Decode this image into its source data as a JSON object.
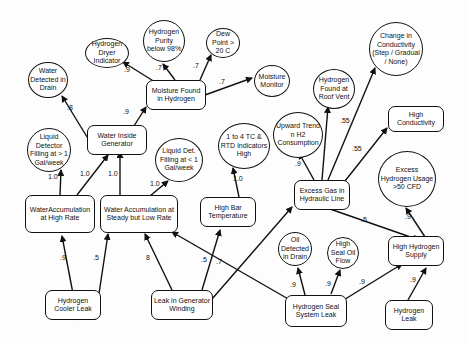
{
  "nodes": {
    "h2_dryer": {
      "label": "Hydrogen Dryer Indicator"
    },
    "h2_purity": {
      "label": "Hydrogen Purity below 98%"
    },
    "dew_point": {
      "label": "Dew Point > 20 C"
    },
    "moisture_monitor": {
      "label": "Moisture Monitor"
    },
    "moisture_found": {
      "label": "Moisture Found in Hydrogen"
    },
    "water_drain": {
      "label": "Water Detected in Drain"
    },
    "liquid_det_gt1": {
      "label": "Liquid Detector Filling at > 1 Gal/week"
    },
    "water_inside": {
      "label": "Water Inside Generator"
    },
    "liquid_det_lt1": {
      "label": "Liquid Det. Filling at < 1 Gal/week"
    },
    "tc_rtd": {
      "label": "1 to 4 TC & RTD Indicators High"
    },
    "upward_trend": {
      "label": "Upward Trend n H2 Consumption"
    },
    "h2_roof_vent": {
      "label": "Hydrogen Found at Roof Vent"
    },
    "conductivity_change": {
      "label": "Change in Conductivity (Step / Gradual / None)"
    },
    "high_conductivity": {
      "label": "High Conductivity"
    },
    "excess_h2_usage": {
      "label": "Excess Hydrogen Usage >50 CFD"
    },
    "excess_gas": {
      "label": "Excess Gas in Hydraulic Line"
    },
    "water_accum_high": {
      "label": "WaterAccumulation at High Rate"
    },
    "water_accum_low": {
      "label": "Water Accumulation at Steady but Low Rate"
    },
    "high_bar_temp": {
      "label": "High Bar Temperature"
    },
    "oil_drain": {
      "label": "Oil Detected in Drain"
    },
    "high_seal_oil": {
      "label": "High Seal Oil Flow"
    },
    "high_h2_supply": {
      "label": "High Hydrogen Supply"
    },
    "h2_cooler_leak": {
      "label": "Hydrogen Cooler Leak"
    },
    "gen_winding_leak": {
      "label": "Leak in Generator Winding"
    },
    "h2_seal_leak": {
      "label": "Hydrogen Seal System Leak"
    },
    "h2_leak": {
      "label": "Hydrogen Leak"
    }
  },
  "edges": [
    {
      "from": "moisture_found",
      "to": "h2_dryer",
      "weight": ".9"
    },
    {
      "from": "moisture_found",
      "to": "h2_purity",
      "weight": ".7"
    },
    {
      "from": "moisture_found",
      "to": "dew_point",
      "weight": ".7"
    },
    {
      "from": "moisture_found",
      "to": "moisture_monitor",
      "weight": ".7"
    },
    {
      "from": "water_inside",
      "to": "water_drain",
      "weight": ".8"
    },
    {
      "from": "water_inside",
      "to": "moisture_found",
      "weight": ".9"
    },
    {
      "from": "water_accum_high",
      "to": "liquid_det_gt1",
      "weight": "1.0"
    },
    {
      "from": "water_accum_high",
      "to": "water_inside",
      "weight": "1.0"
    },
    {
      "from": "water_accum_low",
      "to": "water_inside",
      "weight": "1.0"
    },
    {
      "from": "water_accum_low",
      "to": "liquid_det_lt1",
      "weight": "1.0"
    },
    {
      "from": "high_bar_temp",
      "to": "tc_rtd",
      "weight": "1.0"
    },
    {
      "from": "excess_gas",
      "to": "upward_trend",
      "weight": ".9"
    },
    {
      "from": "excess_gas",
      "to": "h2_roof_vent",
      "weight": ".55"
    },
    {
      "from": "excess_gas",
      "to": "conductivity_change",
      "weight": ".55"
    },
    {
      "from": "excess_gas",
      "to": "high_conductivity",
      "weight": ".55"
    },
    {
      "from": "excess_gas",
      "to": "high_h2_supply",
      "weight": ".5"
    },
    {
      "from": "high_h2_supply",
      "to": "excess_h2_usage",
      "weight": ".9"
    },
    {
      "from": "h2_cooler_leak",
      "to": "water_accum_high",
      "weight": ".9"
    },
    {
      "from": "h2_cooler_leak",
      "to": "water_accum_low",
      "weight": ".5"
    },
    {
      "from": "gen_winding_leak",
      "to": "water_accum_low",
      "weight": ".8"
    },
    {
      "from": "gen_winding_leak",
      "to": "high_bar_temp",
      "weight": ".5"
    },
    {
      "from": "gen_winding_leak",
      "to": "excess_gas",
      "weight": ".7"
    },
    {
      "from": "h2_seal_leak",
      "to": "water_accum_low",
      "weight": ""
    },
    {
      "from": "h2_seal_leak",
      "to": "oil_drain",
      "weight": ".9"
    },
    {
      "from": "h2_seal_leak",
      "to": "high_seal_oil",
      "weight": ".9"
    },
    {
      "from": "h2_seal_leak",
      "to": "high_h2_supply",
      "weight": ".9"
    },
    {
      "from": "h2_leak",
      "to": "high_h2_supply",
      "weight": ".9"
    }
  ],
  "edge_labels": {
    "e0": ".9",
    "e1": ".7",
    "e2": ".7",
    "e3": ".7",
    "e4": ".8",
    "e5": ".9",
    "e6": "1.0",
    "e7": "1.0",
    "e8": "1.0",
    "e9": "1.0",
    "e10": "1.0",
    "e11": ".9",
    "e12": ".55",
    "e13": ".55",
    "e14": ".5",
    "e15": ".9",
    "e16": ".9",
    "e17": ".5",
    "e18": "8",
    "e19": ".5",
    "e20": ".7",
    "e21": ".9",
    "e22": ".9",
    "e23": ".9",
    "e24": ".9"
  }
}
